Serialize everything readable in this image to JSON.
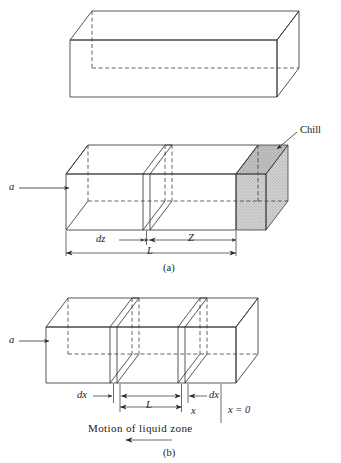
{
  "figure": {
    "colors": {
      "stroke": "#2b2b2b",
      "stroke_light": "#4a4a4a",
      "chill_fill": "#d0d0d0",
      "chill_fill_dark": "#bdbdbd",
      "background": "#ffffff",
      "text": "#1a1a1a"
    },
    "panels": [
      {
        "id": "panel-top",
        "caption": "",
        "description": "plain rectangular bar in isometric view with hidden edges dashed"
      },
      {
        "id": "panel-a",
        "caption": "(a)",
        "description": "bar with differential slab dz, zone length Z measured to chill block"
      },
      {
        "id": "panel-b",
        "caption": "(b)",
        "description": "bar with two differential slabs dx bounding a liquid zone of length L"
      }
    ]
  },
  "labels": {
    "panel_a": {
      "inlet": "a",
      "chill": "Chill",
      "dz": "dz",
      "Z": "Z",
      "L": "L",
      "caption": "(a)"
    },
    "panel_b": {
      "inlet": "a",
      "dx_left": "dx",
      "dx_right": "dx",
      "L": "L",
      "x": "x",
      "origin": "x = 0",
      "motion": "Motion of liquid zone",
      "caption": "(b)"
    }
  },
  "icons": {
    "arrow_right": "arrow-right-icon",
    "arrow_left": "arrow-left-icon",
    "leader_line": "leader-line-icon"
  }
}
